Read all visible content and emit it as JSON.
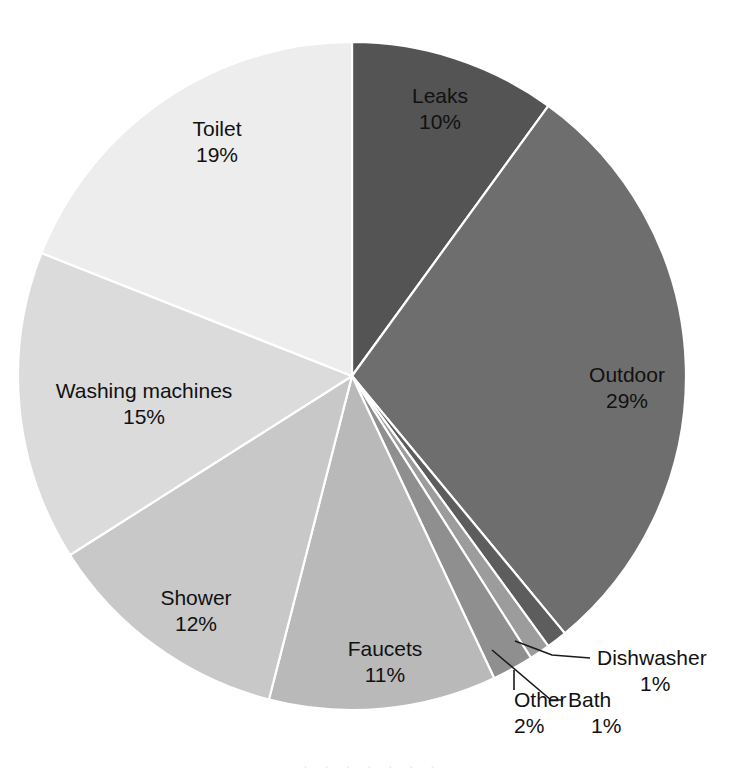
{
  "chart_data": {
    "type": "pie",
    "title": "",
    "subtitle": "",
    "xlabel": "",
    "ylabel": "",
    "legend_position": "none",
    "grid": false,
    "units": "percent",
    "start_angle_deg": 0,
    "direction": "clockwise",
    "center": {
      "x": 352,
      "y": 376
    },
    "radius": 334,
    "categories": [
      "Leaks",
      "Outdoor",
      "Dishwasher",
      "Bath",
      "Other",
      "Faucets",
      "Shower",
      "Washing machines",
      "Toilet"
    ],
    "values": [
      10,
      29,
      1,
      1,
      2,
      11,
      12,
      15,
      19
    ],
    "total": 100,
    "slices": [
      {
        "id": "leaks",
        "label": "Leaks",
        "percent_text": "10%",
        "value": 10,
        "color": "#545454",
        "label_mode": "inside",
        "label_x": 440,
        "label_y": 103,
        "pct_x": 440,
        "pct_y": 129
      },
      {
        "id": "outdoor",
        "label": "Outdoor",
        "percent_text": "29%",
        "value": 29,
        "color": "#6e6e6e",
        "label_mode": "inside",
        "label_x": 627,
        "label_y": 382,
        "pct_x": 627,
        "pct_y": 408
      },
      {
        "id": "dishwasher",
        "label": "Dishwasher",
        "percent_text": "1%",
        "value": 1,
        "color": "#5d5d5d",
        "label_mode": "callout",
        "label_x": 597,
        "label_y": 665,
        "pct_x": 640,
        "pct_y": 691,
        "leader": [
          [
            515,
            641
          ],
          [
            552,
            655
          ],
          [
            590,
            658
          ]
        ]
      },
      {
        "id": "bath",
        "label": "Bath",
        "percent_text": "1%",
        "value": 1,
        "color": "#9c9c9c",
        "label_mode": "callout",
        "label_x": 568,
        "label_y": 707,
        "pct_x": 591,
        "pct_y": 733,
        "leader": [
          [
            492,
            650
          ],
          [
            551,
            700
          ],
          [
            562,
            700
          ]
        ]
      },
      {
        "id": "other",
        "label": "Other",
        "percent_text": "2%",
        "value": 2,
        "color": "#8f8f8f",
        "label_mode": "callout",
        "label_x": 514,
        "label_y": 707,
        "pct_x": 514,
        "pct_y": 733,
        "leader": [
          [
            514,
            670
          ],
          [
            514,
            690
          ]
        ]
      },
      {
        "id": "faucets",
        "label": "Faucets",
        "percent_text": "11%",
        "value": 11,
        "color": "#b9b9b9",
        "label_mode": "inside",
        "label_x": 385,
        "label_y": 656,
        "pct_x": 385,
        "pct_y": 682
      },
      {
        "id": "shower",
        "label": "Shower",
        "percent_text": "12%",
        "value": 12,
        "color": "#c8c8c8",
        "label_mode": "inside",
        "label_x": 196,
        "label_y": 605,
        "pct_x": 196,
        "pct_y": 631
      },
      {
        "id": "washing-machines",
        "label": "Washing machines",
        "percent_text": "15%",
        "value": 15,
        "color": "#dbdbdb",
        "label_mode": "inside",
        "label_x": 144,
        "label_y": 398,
        "pct_x": 144,
        "pct_y": 424
      },
      {
        "id": "toilet",
        "label": "Toilet",
        "percent_text": "19%",
        "value": 19,
        "color": "#ededed",
        "label_mode": "inside",
        "label_x": 217,
        "label_y": 136,
        "pct_x": 217,
        "pct_y": 162
      }
    ]
  },
  "figure": {
    "background_color": "#ffffff",
    "separator_color": "#ffffff",
    "label_text_color": "#111111",
    "bottom_artifact_text": "·   ·    ·  ·   ·   ·    ·"
  }
}
